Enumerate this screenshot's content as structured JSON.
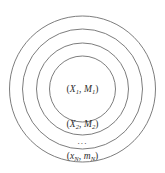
{
  "figure": {
    "type": "concentric-circles-diagram",
    "background_color": "#ffffff",
    "stroke_color": "#6e6e6e",
    "text_color": "#2c2c2c",
    "center": {
      "x": 82.5,
      "y": 89
    },
    "rings": [
      {
        "index": 1,
        "name": "outer-ring",
        "radius": 73,
        "label": {
          "open": "(",
          "var": "x",
          "var_sub": "N",
          "comma": ", ",
          "mass": "m",
          "mass_sub": "N",
          "close": ")",
          "plain": "(x_N, m_N)"
        }
      },
      {
        "index": 2,
        "name": "third-ring",
        "radius": 60,
        "label": {
          "plain": "..."
        }
      },
      {
        "index": 3,
        "name": "second-ring",
        "radius": 46,
        "label": {
          "open": "(",
          "var": "X",
          "var_sub": "2",
          "comma": ", ",
          "mass": "M",
          "mass_sub": "2",
          "close": ")",
          "plain": "(X_2, M_2)"
        }
      },
      {
        "index": 4,
        "name": "inner-ring",
        "radius": 33,
        "label": {
          "open": "(",
          "var": "X",
          "var_sub": "1",
          "comma": ", ",
          "mass": "M",
          "mass_sub": "1",
          "close": ")",
          "plain": "(X_1, M_1)"
        }
      }
    ],
    "labels": {
      "inner": {
        "open": "(",
        "var": "X",
        "var_sub": "1",
        "comma": ", ",
        "mass": "M",
        "mass_sub": "1",
        "close": ")"
      },
      "second": {
        "open": "(",
        "var": "X",
        "var_sub": "2",
        "comma": ", ",
        "mass": "M",
        "mass_sub": "2",
        "close": ")"
      },
      "ellipsis": "...",
      "outer": {
        "open": "(",
        "var": "x",
        "var_sub": "N",
        "comma": ", ",
        "mass": "m",
        "mass_sub": "N",
        "close": ")"
      }
    }
  }
}
